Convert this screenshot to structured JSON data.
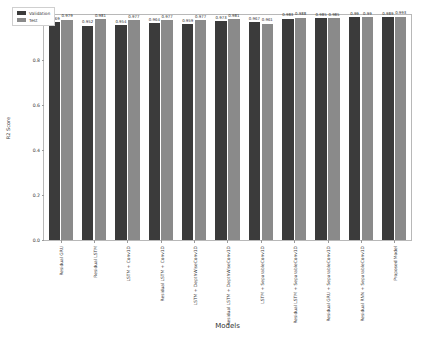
{
  "chart_data": {
    "type": "bar",
    "title": "",
    "xlabel": "Models",
    "ylabel": "R2 Score",
    "ylim": [
      0.0,
      1.0
    ],
    "yticks": [
      "0.0",
      "0.2",
      "0.4",
      "0.6",
      "0.8",
      "1.0"
    ],
    "grid": false,
    "legend_position": "upper left",
    "categories": [
      "Residual GRU",
      "Residual LSTM",
      "LSTM + Conv1D",
      "Residual LSTM + Conv1D",
      "LSTM + DepthWiseConv1D",
      "Residual LSTM + DepthWiseConv1D",
      "LSTM + SeparableConv1D",
      "Residual LSTM + SeparableConv1D",
      "Residual GRU + SeparableConv1D",
      "Residual RNN + SeparableConv1D",
      "Proposed Model"
    ],
    "series": [
      {
        "name": "Validation",
        "color": "#3b3b3b",
        "values": [
          0.969,
          0.952,
          0.954,
          0.964,
          0.959,
          0.973,
          0.967,
          0.983,
          0.985,
          0.99,
          0.989
        ],
        "labels": [
          "0.969",
          "0.952",
          "0.954",
          "0.964",
          "0.959",
          "0.973",
          "0.967",
          "0.983",
          "0.985",
          "0.99",
          "0.989"
        ]
      },
      {
        "name": "Test",
        "color": "#8a8a8a",
        "values": [
          0.979,
          0.981,
          0.977,
          0.977,
          0.977,
          0.981,
          0.961,
          0.988,
          0.985,
          0.99,
          0.993
        ],
        "labels": [
          "0.979",
          "0.981",
          "0.977",
          "0.977",
          "0.977",
          "0.981",
          "0.961",
          "0.988",
          "0.985",
          "0.99",
          "0.993"
        ]
      }
    ]
  },
  "legend": {
    "items": [
      {
        "label": "Validation"
      },
      {
        "label": "Test"
      }
    ]
  }
}
